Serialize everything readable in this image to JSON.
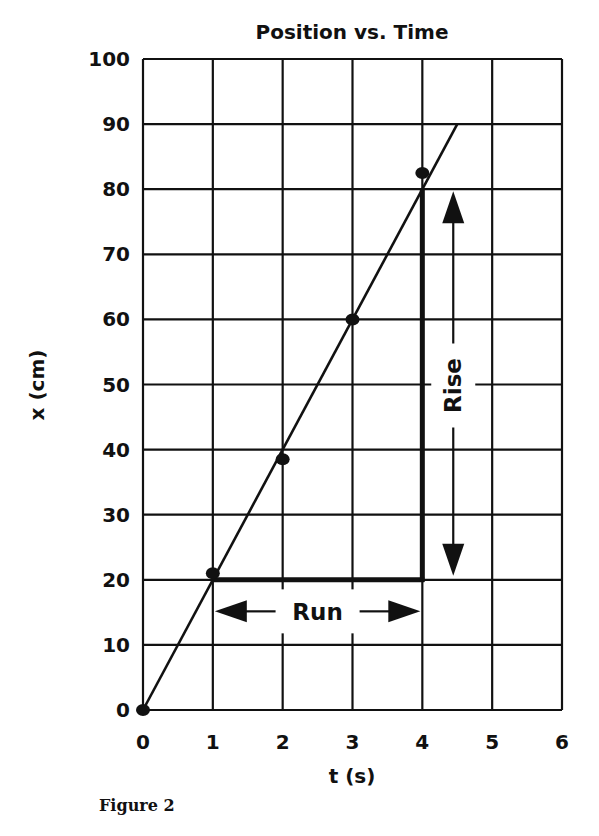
{
  "chart_data": {
    "type": "scatter",
    "title": "Position vs. Time",
    "xlabel": "t (s)",
    "ylabel": "x (cm)",
    "xlim": [
      0,
      6
    ],
    "ylim": [
      0,
      100
    ],
    "x_ticks": [
      0,
      1,
      2,
      3,
      4,
      5,
      6
    ],
    "y_ticks": [
      0,
      10,
      20,
      30,
      40,
      50,
      60,
      70,
      80,
      90,
      100
    ],
    "grid": true,
    "legend": null,
    "series": [
      {
        "name": "measured position",
        "type": "scatter",
        "x": [
          0,
          1,
          2,
          3,
          4
        ],
        "y": [
          0,
          21,
          38.5,
          60,
          82.5
        ]
      },
      {
        "name": "best-fit line",
        "type": "line",
        "x": [
          0,
          4.5
        ],
        "y": [
          0,
          90
        ]
      }
    ],
    "annotations": [
      {
        "text": "Run",
        "type": "horizontal-arrow",
        "from": [
          1,
          15
        ],
        "to": [
          4,
          15
        ],
        "segment": {
          "from": [
            1,
            20
          ],
          "to": [
            4,
            20
          ]
        }
      },
      {
        "text": "Rise",
        "type": "vertical-arrow",
        "from": [
          4.5,
          20
        ],
        "to": [
          4.5,
          80
        ],
        "segment": {
          "from": [
            4,
            20
          ],
          "to": [
            4,
            80
          ]
        }
      }
    ]
  },
  "chart": {
    "title": "Position vs. Time",
    "xlabel": "t (s)",
    "ylabel": "x (cm)",
    "run_label": "Run",
    "rise_label": "Rise"
  },
  "caption": "Figure 2"
}
